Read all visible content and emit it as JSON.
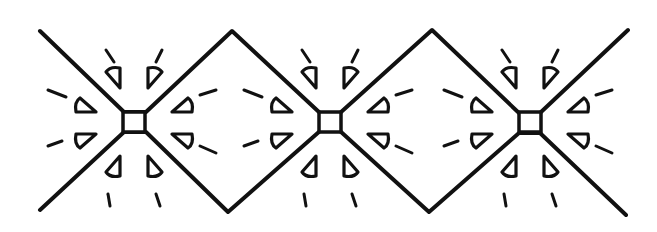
{
  "artwork": {
    "title": "",
    "description": "Black line-art border pattern: zigzag diamond band with three radiating star motifs",
    "colors": {
      "ink": "#111111",
      "paper": "#ffffff"
    },
    "motifs": [
      {
        "name": "motif-1",
        "cx": 134,
        "cy": 122
      },
      {
        "name": "motif-2",
        "cx": 330,
        "cy": 122
      },
      {
        "name": "motif-3",
        "cx": 530,
        "cy": 122
      }
    ],
    "zigzag_top": [
      [
        40,
        31
      ],
      [
        124,
        112
      ],
      [
        146,
        112
      ],
      [
        232,
        31
      ],
      [
        320,
        113
      ],
      [
        340,
        113
      ],
      [
        432,
        30
      ],
      [
        519,
        113
      ],
      [
        540,
        113
      ],
      [
        628,
        30
      ]
    ],
    "zigzag_bottom": [
      [
        40,
        210
      ],
      [
        124,
        132
      ],
      [
        146,
        132
      ],
      [
        228,
        212
      ],
      [
        320,
        131
      ],
      [
        340,
        131
      ],
      [
        429,
        212
      ],
      [
        519,
        133
      ],
      [
        540,
        133
      ],
      [
        626,
        215
      ]
    ]
  }
}
